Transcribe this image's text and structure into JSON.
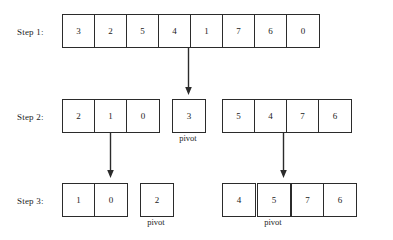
{
  "diagram": {
    "line_color": "#2b2b2b",
    "text_color": "#1c1c1c",
    "background": "#ffffff",
    "steps": [
      {
        "label": "Step 1:",
        "groups": [
          {
            "values": [
              "3",
              "2",
              "5",
              "4",
              "1",
              "7",
              "6",
              "0"
            ],
            "pivot_caption": ""
          }
        ]
      },
      {
        "label": "Step 2:",
        "groups": [
          {
            "values": [
              "2",
              "1",
              "0"
            ],
            "pivot_caption": ""
          },
          {
            "values": [
              "3"
            ],
            "pivot_caption": "pivot"
          },
          {
            "values": [
              "5",
              "4",
              "7",
              "6"
            ],
            "pivot_caption": ""
          }
        ]
      },
      {
        "label": "Step 3:",
        "groups": [
          {
            "values": [
              "1",
              "0"
            ],
            "pivot_caption": ""
          },
          {
            "values": [
              "2"
            ],
            "pivot_caption": "pivot"
          },
          {
            "values": [
              "4"
            ],
            "pivot_caption": ""
          },
          {
            "values": [
              "5"
            ],
            "pivot_caption": "pivot"
          },
          {
            "values": [
              "7",
              "6"
            ],
            "pivot_caption": ""
          }
        ]
      }
    ],
    "arrows": [
      {
        "name": "arrow-step1-to-pivot-3"
      },
      {
        "name": "arrow-step2-left-to-pivot-2"
      },
      {
        "name": "arrow-step2-right-to-pivot-5"
      }
    ]
  }
}
